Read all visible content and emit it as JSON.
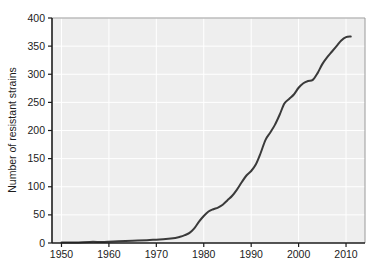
{
  "chart_data": {
    "type": "line",
    "title": "",
    "xlabel": "",
    "ylabel": "Number of resistant strains",
    "xlim": [
      1948,
      2014
    ],
    "ylim": [
      0,
      400
    ],
    "grid": true,
    "legend": "none",
    "x_ticks": [
      1950,
      1960,
      1970,
      1980,
      1990,
      2000,
      2010
    ],
    "y_ticks": [
      0,
      50,
      100,
      150,
      200,
      250,
      300,
      350,
      400
    ],
    "x_tick_labels": [
      "1950",
      "1960",
      "1970",
      "1980",
      "1990",
      "2000",
      "2010"
    ],
    "y_tick_labels": [
      "0",
      "50",
      "100",
      "150",
      "200",
      "250",
      "300",
      "350",
      "400"
    ],
    "series": [
      {
        "name": "Number of resistant strains",
        "color": "#3a3a3a",
        "x": [
          1950,
          1953,
          1956,
          1959,
          1962,
          1965,
          1968,
          1970,
          1972,
          1974,
          1975,
          1976,
          1977,
          1978,
          1979,
          1980,
          1981,
          1982,
          1983,
          1984,
          1985,
          1986,
          1987,
          1988,
          1989,
          1990,
          1991,
          1992,
          1993,
          1994,
          1995,
          1996,
          1997,
          1998,
          1999,
          2000,
          2001,
          2002,
          2003,
          2004,
          2005,
          2006,
          2007,
          2008,
          2009,
          2010,
          2011
        ],
        "y": [
          1,
          1,
          2,
          2,
          3,
          4,
          5,
          6,
          7,
          9,
          11,
          14,
          18,
          26,
          38,
          48,
          56,
          60,
          63,
          68,
          76,
          84,
          95,
          108,
          120,
          128,
          140,
          160,
          183,
          196,
          210,
          228,
          248,
          256,
          264,
          276,
          284,
          288,
          290,
          302,
          318,
          330,
          340,
          350,
          360,
          366,
          367
        ]
      }
    ]
  },
  "figure": {
    "background_color": "#ffffff",
    "plot_background_color": "#eeeeee",
    "gridline_color": "#ffffff",
    "axis_color": "#1c1c1c",
    "frame_color": "#9a9a9a"
  }
}
